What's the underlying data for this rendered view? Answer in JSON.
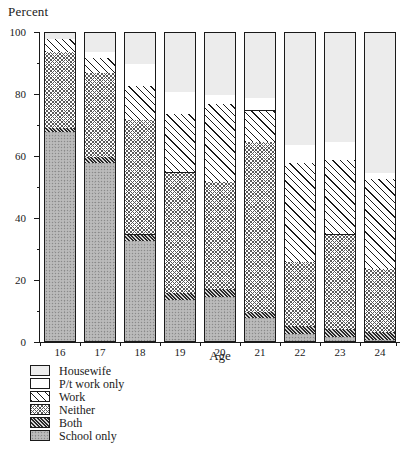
{
  "chart_data": {
    "type": "bar",
    "title": "",
    "xlabel": "Age",
    "ylabel": "Percent",
    "ylim": [
      0,
      100
    ],
    "grid": false,
    "stacked": true,
    "legend_position": "bottom-left",
    "ytick_labels": [
      "0",
      "20",
      "40",
      "60",
      "80",
      "100"
    ],
    "ytick_values": [
      0,
      20,
      40,
      60,
      80,
      100
    ],
    "yminor_values": [
      10,
      30,
      50,
      70,
      90
    ],
    "categories": [
      "16",
      "17",
      "18",
      "19",
      "20",
      "21",
      "22",
      "23",
      "24"
    ],
    "series": [
      {
        "name": "School only",
        "key": "school",
        "values": [
          68,
          58,
          33,
          14,
          15,
          8,
          3,
          2,
          1
        ]
      },
      {
        "name": "Both",
        "key": "both",
        "values": [
          1.5,
          2,
          2,
          2,
          2.5,
          2,
          2.5,
          2.5,
          2.5
        ]
      },
      {
        "name": "Neither",
        "key": "neither",
        "values": [
          24.5,
          27,
          37,
          39,
          34.5,
          55,
          20.5,
          30.5,
          20.5
        ]
      },
      {
        "name": "Work",
        "key": "work",
        "values": [
          4,
          5,
          11,
          19,
          25,
          10,
          32,
          24,
          29
        ]
      },
      {
        "name": "P/t work only",
        "key": "pt",
        "values": [
          0,
          2,
          7,
          7,
          3,
          4,
          6,
          6,
          2
        ]
      },
      {
        "name": "Housewife",
        "key": "housewife",
        "values": [
          2,
          6,
          10,
          19,
          20,
          21,
          36,
          35,
          45
        ]
      }
    ]
  },
  "legend": {
    "items": [
      {
        "label": "Housewife",
        "key": "housewife"
      },
      {
        "label": "P/t work only",
        "key": "pt"
      },
      {
        "label": "Work",
        "key": "work"
      },
      {
        "label": "Neither",
        "key": "neither"
      },
      {
        "label": "Both",
        "key": "both"
      },
      {
        "label": "School only",
        "key": "school"
      }
    ]
  }
}
